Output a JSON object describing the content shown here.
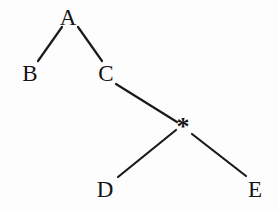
{
  "diagram": {
    "type": "binary-tree",
    "background_color": "#fdfdfd",
    "stroke_color": "#1a1a1a",
    "text_color": "#141414",
    "stroke_width": 2.2,
    "width": 278,
    "height": 211,
    "nodes": [
      {
        "id": "A",
        "label": "A",
        "kind": "letter",
        "x": 68,
        "y": 17,
        "font_size": 23
      },
      {
        "id": "B",
        "label": "B",
        "kind": "letter",
        "x": 30,
        "y": 73,
        "font_size": 23
      },
      {
        "id": "C",
        "label": "C",
        "kind": "letter",
        "x": 106,
        "y": 73,
        "font_size": 23
      },
      {
        "id": "STAR",
        "label": "*",
        "kind": "operator",
        "x": 183,
        "y": 127,
        "font_size": 26
      },
      {
        "id": "D",
        "label": "D",
        "kind": "letter",
        "x": 105,
        "y": 189,
        "font_size": 23
      },
      {
        "id": "E",
        "label": "E",
        "kind": "letter",
        "x": 255,
        "y": 189,
        "font_size": 23
      }
    ],
    "edges": [
      {
        "id": "A-B",
        "from": "A",
        "to": "B",
        "x1": 62,
        "y1": 27,
        "x2": 38,
        "y2": 61
      },
      {
        "id": "A-C",
        "from": "A",
        "to": "C",
        "x1": 78,
        "y1": 27,
        "x2": 102,
        "y2": 61
      },
      {
        "id": "C-STAR",
        "from": "C",
        "to": "STAR",
        "x1": 116,
        "y1": 84,
        "x2": 177,
        "y2": 122
      },
      {
        "id": "STAR-D",
        "from": "STAR",
        "to": "D",
        "x1": 176,
        "y1": 130,
        "x2": 118,
        "y2": 177
      },
      {
        "id": "STAR-E",
        "from": "STAR",
        "to": "E",
        "x1": 192,
        "y1": 134,
        "x2": 246,
        "y2": 176
      }
    ]
  }
}
